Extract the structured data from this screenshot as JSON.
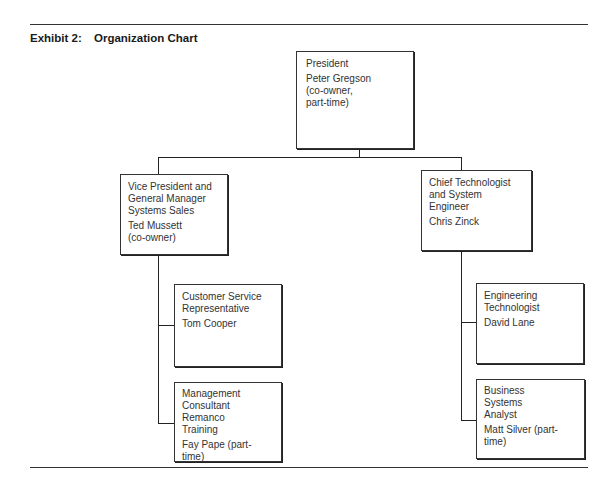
{
  "exhibit": {
    "label": "Exhibit 2:",
    "title": "Organization Chart"
  },
  "nodes": {
    "president": {
      "role": "President",
      "name": "Peter Gregson\n(co-owner,\npart-time)"
    },
    "vp": {
      "role": "Vice President and\nGeneral Manager\nSystems Sales",
      "name": "Ted Mussett\n(co-owner)"
    },
    "cto": {
      "role": "Chief Technologist\nand System Engineer",
      "name": "Chris Zinck"
    },
    "csr": {
      "role": "Customer Service\nRepresentative",
      "name": "Tom Cooper"
    },
    "mc": {
      "role": "Management\nConsultant\nRemanco\nTraining",
      "name": "Fay Pape (part-time)"
    },
    "et": {
      "role": "Engineering\nTechnologist",
      "name": "David Lane"
    },
    "bsa": {
      "role": "Business\nSystems\nAnalyst",
      "name": "Matt Silver (part-time)"
    }
  },
  "hierarchy": {
    "president": [
      "vp",
      "cto"
    ],
    "vp": [
      "csr",
      "mc"
    ],
    "cto": [
      "et",
      "bsa"
    ]
  }
}
